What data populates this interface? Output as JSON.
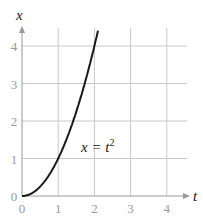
{
  "chart_data": {
    "type": "line",
    "title": "",
    "xlabel": "t",
    "ylabel": "x",
    "xlim": [
      0,
      4.5
    ],
    "ylim": [
      0,
      4.5
    ],
    "x_ticks": [
      "0",
      "1",
      "2",
      "3",
      "4"
    ],
    "y_ticks": [
      "0",
      "1",
      "2",
      "3",
      "4"
    ],
    "grid": true,
    "series": [
      {
        "name": "x = t^2",
        "x": [
          0,
          0.25,
          0.5,
          0.75,
          1,
          1.25,
          1.5,
          1.75,
          2,
          2.1
        ],
        "values": [
          0,
          0.0625,
          0.25,
          0.5625,
          1,
          1.5625,
          2.25,
          3.0625,
          4,
          4.41
        ]
      }
    ],
    "annotations": [
      {
        "text": "x = t",
        "superscript": "2",
        "x": 1.55,
        "y": 2.1
      }
    ]
  },
  "labels": {
    "x_axis": "t",
    "y_axis": "x",
    "curve_main": "x = t",
    "curve_sup": "2"
  }
}
